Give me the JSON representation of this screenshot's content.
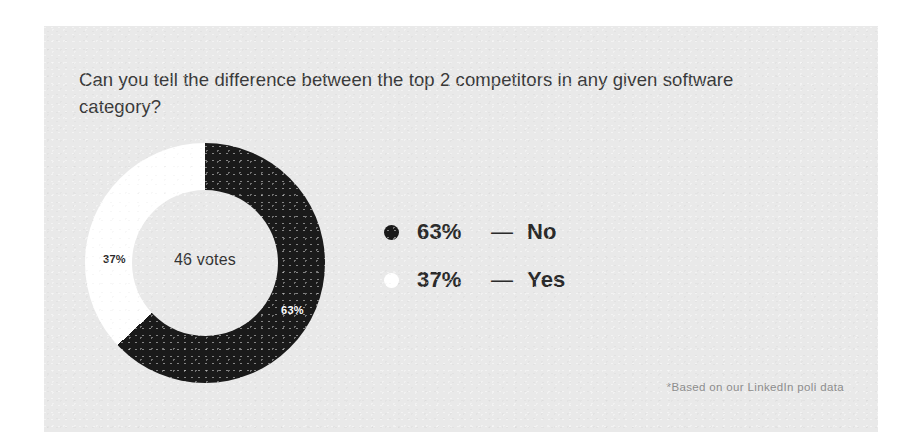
{
  "card": {
    "background_color": "#e9e9e9",
    "page_background_color": "#ffffff"
  },
  "question": "Can you tell the difference between the top 2 competitors in any given software category?",
  "center_label": "46 votes",
  "footnote": "*Based on our LinkedIn poll data",
  "legend": {
    "rows": [
      {
        "dot": "filled-black-dot",
        "percent": "63%",
        "dash": "—",
        "name": "No",
        "color": "#1a1a1a"
      },
      {
        "dot": "filled-white-dot",
        "percent": "37%",
        "dash": "—",
        "name": "Yes",
        "color": "#ffffff"
      }
    ]
  },
  "slice_labels": {
    "no": "63%",
    "yes": "37%"
  },
  "chart_data": {
    "type": "pie",
    "variant": "donut",
    "title": "Can you tell the difference between the top 2 competitors in any given software category?",
    "center_text": "46 votes",
    "total_votes": 46,
    "labels": [
      "No",
      "Yes"
    ],
    "values": [
      63,
      37
    ],
    "value_unit": "percent",
    "data_labels": [
      "63%",
      "37%"
    ],
    "colors": [
      "#1a1a1a",
      "#ffffff"
    ],
    "start_angle_deg": 0,
    "direction": "clockwise",
    "inner_radius_ratio": 0.61,
    "legend_position": "right",
    "grid": false,
    "annotation": "*Based on our LinkedIn poll data"
  }
}
